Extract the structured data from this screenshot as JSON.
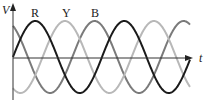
{
  "chart_data": {
    "type": "line",
    "title": "",
    "xlabel": "t",
    "ylabel": "V",
    "grid": false,
    "legend_position": "inline-top",
    "period_px": 89,
    "amplitude": 1,
    "series": [
      {
        "name": "R",
        "phase_deg": 0,
        "color": "#1a1a1a"
      },
      {
        "name": "Y",
        "phase_deg": -120,
        "color": "#b8b8b8"
      },
      {
        "name": "B",
        "phase_deg": -240,
        "color": "#7a7a7a"
      }
    ]
  },
  "labels": {
    "y_axis": "V",
    "x_axis": "t",
    "R": "R",
    "Y": "Y",
    "B": "B"
  }
}
